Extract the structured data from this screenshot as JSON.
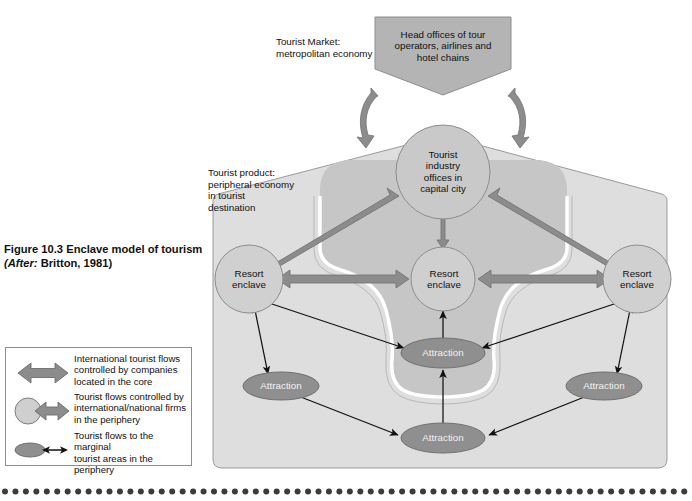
{
  "figure": {
    "number_title": "Figure 10.3  Enclave model of tourism",
    "source_prefix": "(After:",
    "source_rest": " Britton, 1981)"
  },
  "diagram": {
    "title": "Enclave model of tourism",
    "annotations": {
      "market": "Tourist Market:\nmetropolitan economy",
      "product": "Tourist product:\nperipheral economy\nin tourist\ndestination"
    },
    "nodes": {
      "head_offices": "Head offices of tour\noperators, airlines and\nhotel chains",
      "capital_city": "Tourist\nindustry\noffices in\ncapital city",
      "resort_left": "Resort\nenclave",
      "resort_centre": "Resort\nenclave",
      "resort_right": "Resort\nenclave",
      "attraction_centre_upper": "Attraction",
      "attraction_left": "Attraction",
      "attraction_right": "Attraction",
      "attraction_bottom": "Attraction"
    }
  },
  "legend": {
    "items": [
      {
        "symbol": "double-headed-thick-arrow",
        "text": "International tourist flows\ncontrolled by companies\nlocated in the core"
      },
      {
        "symbol": "circle-with-double-headed-thick-arrow",
        "text": "Tourist flows controlled by\ninternational/national firms\nin the periphery"
      },
      {
        "symbol": "ellipse-with-thin-double-headed-arrow",
        "text": "Tourist flows to the marginal\ntourist areas in the periphery"
      }
    ]
  },
  "colors": {
    "page_bg": "#ffffff",
    "outer_region": "#dedede",
    "inner_region": "#c6c6c6",
    "box_fill": "#b4b4b4",
    "circle_fill": "#c9c9c9",
    "ellipse_fill": "#8f8f8f",
    "thick_arrow_fill": "#8c8c8c",
    "thin_arrow": "#111111",
    "outline": "#8d8d8d",
    "channel_white": "#ffffff",
    "dot_rule": "#3b3b3b"
  }
}
